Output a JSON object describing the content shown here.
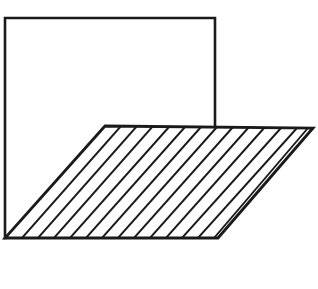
{
  "figure": {
    "background_color": "#ffffff",
    "stroke_color": "#1a1a1a",
    "canvas": {
      "width": 318,
      "height": 289
    },
    "outline_stroke_width": 2.6,
    "hatch_stroke_width": 1.9,
    "square": {
      "name": "open-square-outline",
      "description": "Square outline drawn on top and both sides, open along the bottom",
      "top_left": [
        5,
        18
      ],
      "top_right": [
        215,
        18
      ],
      "bottom_left": [
        5,
        238
      ],
      "right_edge_end": [
        215,
        126
      ],
      "path": "M 5 238 L 5 18 L 215 18 L 215 126"
    },
    "parallelogram": {
      "name": "hatched-parallelogram",
      "description": "Parallelogram filled with parallel diagonal hatch lines",
      "top_left": [
        105,
        126
      ],
      "top_right": [
        313,
        128
      ],
      "bottom_right": [
        218,
        238
      ],
      "bottom_left": [
        5,
        238
      ],
      "path": "M 105 126 L 313 128 L 218 238 L 5 238 Z"
    },
    "hatching": {
      "name": "diagonal-hatch-lines",
      "direction": "parallel to the slanted left and right edges",
      "count": 13,
      "top_start_x": 121,
      "top_spacing": 16.0,
      "bottom_spacing": 16.4,
      "slant_dx": -100,
      "slant_dy": 112,
      "lines": [
        {
          "x1": 121,
          "y1": 126,
          "x2": 22,
          "y2": 238
        },
        {
          "x1": 137,
          "y1": 126,
          "x2": 38,
          "y2": 238
        },
        {
          "x1": 153,
          "y1": 126,
          "x2": 54,
          "y2": 238
        },
        {
          "x1": 169,
          "y1": 127,
          "x2": 70,
          "y2": 238
        },
        {
          "x1": 185,
          "y1": 127,
          "x2": 86,
          "y2": 238
        },
        {
          "x1": 201,
          "y1": 127,
          "x2": 102,
          "y2": 238
        },
        {
          "x1": 217,
          "y1": 127,
          "x2": 118,
          "y2": 238
        },
        {
          "x1": 233,
          "y1": 127,
          "x2": 134,
          "y2": 238
        },
        {
          "x1": 249,
          "y1": 127,
          "x2": 150,
          "y2": 238
        },
        {
          "x1": 265,
          "y1": 127,
          "x2": 166,
          "y2": 238
        },
        {
          "x1": 281,
          "y1": 128,
          "x2": 182,
          "y2": 238
        },
        {
          "x1": 297,
          "y1": 128,
          "x2": 198,
          "y2": 238
        },
        {
          "x1": 308,
          "y1": 128,
          "x2": 214,
          "y2": 238
        }
      ]
    }
  },
  "caption": {
    "name": "figure-caption",
    "note": "Caption text is clipped by the bottom edge of the image; only the uppermost few pixels of the glyphs are visible and the words are not legible.",
    "left_fragment": "",
    "right_fragment": ""
  }
}
